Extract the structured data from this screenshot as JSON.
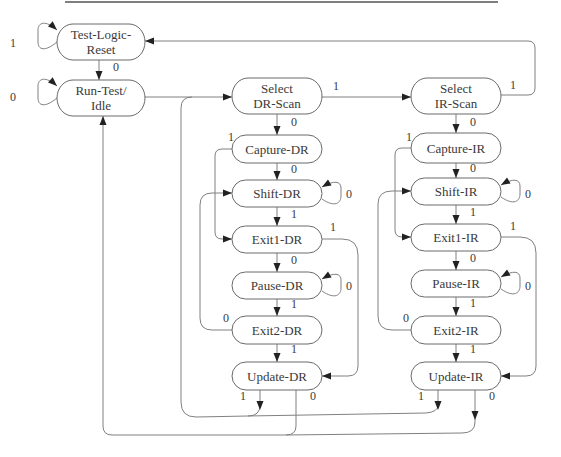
{
  "diagram": {
    "states": [
      {
        "id": "tlr",
        "lines": [
          "Test-Logic-",
          "Reset"
        ],
        "x": 57,
        "y": 24,
        "w": 88,
        "h": 36
      },
      {
        "id": "rti",
        "lines": [
          "Run-Test/",
          "Idle"
        ],
        "x": 57,
        "y": 80,
        "w": 88,
        "h": 36
      },
      {
        "id": "sdr",
        "lines": [
          "Select",
          "DR-Scan"
        ],
        "x": 232,
        "y": 78,
        "w": 90,
        "h": 36
      },
      {
        "id": "cdr",
        "lines": [
          "Capture-DR"
        ],
        "x": 232,
        "y": 135,
        "w": 90,
        "h": 28
      },
      {
        "id": "shdr",
        "lines": [
          "Shift-DR"
        ],
        "x": 232,
        "y": 180,
        "w": 90,
        "h": 27
      },
      {
        "id": "e1dr",
        "lines": [
          "Exit1-DR"
        ],
        "x": 232,
        "y": 226,
        "w": 90,
        "h": 27
      },
      {
        "id": "pdr",
        "lines": [
          "Pause-DR"
        ],
        "x": 232,
        "y": 272,
        "w": 90,
        "h": 27
      },
      {
        "id": "e2dr",
        "lines": [
          "Exit2-DR"
        ],
        "x": 232,
        "y": 316,
        "w": 90,
        "h": 28
      },
      {
        "id": "udr",
        "lines": [
          "Update-DR"
        ],
        "x": 232,
        "y": 362,
        "w": 90,
        "h": 28
      },
      {
        "id": "sir",
        "lines": [
          "Select",
          "IR-Scan"
        ],
        "x": 411,
        "y": 78,
        "w": 90,
        "h": 36
      },
      {
        "id": "cir",
        "lines": [
          "Capture-IR"
        ],
        "x": 411,
        "y": 133,
        "w": 90,
        "h": 30
      },
      {
        "id": "shir",
        "lines": [
          "Shift-IR"
        ],
        "x": 411,
        "y": 178,
        "w": 90,
        "h": 27
      },
      {
        "id": "e1ir",
        "lines": [
          "Exit1-IR"
        ],
        "x": 411,
        "y": 224,
        "w": 90,
        "h": 27
      },
      {
        "id": "pir",
        "lines": [
          "Pause-IR"
        ],
        "x": 411,
        "y": 270,
        "w": 90,
        "h": 27
      },
      {
        "id": "e2ir",
        "lines": [
          "Exit2-IR"
        ],
        "x": 411,
        "y": 316,
        "w": 90,
        "h": 28
      },
      {
        "id": "uir",
        "lines": [
          "Update-IR"
        ],
        "x": 411,
        "y": 362,
        "w": 90,
        "h": 28
      }
    ],
    "edges": [
      {
        "from": "tlr",
        "to": "tlr",
        "label": "1",
        "d": "M57,42 C45,52 38,50 38,42 L38,30 C38,22 46,20 57,30",
        "arrow": [
          57,
          30
        ],
        "lx": 10,
        "ly": 47
      },
      {
        "from": "tlr",
        "to": "rti",
        "label": "0",
        "d": "M99,60 L99,80",
        "arrow": [
          99,
          80
        ],
        "lx": 113,
        "ly": 71
      },
      {
        "from": "rti",
        "to": "rti",
        "label": "0",
        "d": "M57,98 C45,108 38,106 38,98 L38,86 C38,78 46,76 57,86",
        "arrow": [
          57,
          86
        ],
        "lx": 10,
        "ly": 101
      },
      {
        "from": "rti",
        "to": "sdr",
        "label": "",
        "d": "M145,97 L232,97",
        "arrow": [
          232,
          97
        ],
        "lx": 0,
        "ly": 0
      },
      {
        "from": "sdr",
        "to": "sir",
        "label": "1",
        "d": "M322,97 L411,97",
        "arrow": [
          411,
          97
        ],
        "lx": 333,
        "ly": 90
      },
      {
        "from": "sir",
        "to": "tlr",
        "label": "1",
        "d": "M501,95 L528,95 Q535,95 535,88 L535,48 Q535,41 528,41 L145,41",
        "arrow": [
          145,
          41
        ],
        "lx": 510,
        "ly": 89
      },
      {
        "from": "sdr",
        "to": "cdr",
        "label": "0",
        "d": "M277,114 L277,135",
        "arrow": [
          277,
          135
        ],
        "lx": 291,
        "ly": 126
      },
      {
        "from": "sir",
        "to": "cir",
        "label": "0",
        "d": "M456,114 L456,133",
        "arrow": [
          456,
          133
        ],
        "lx": 470,
        "ly": 126
      },
      {
        "from": "cdr",
        "to": "shdr",
        "label": "0",
        "d": "M277,163 L277,180",
        "arrow": [
          277,
          180
        ],
        "lx": 291,
        "ly": 173
      },
      {
        "from": "cdr",
        "to": "e1dr",
        "label": "1",
        "d": "M232,149 L222,149 Q215,149 215,156 L215,232 Q215,239 222,239 L232,239",
        "arrow": [
          232,
          239
        ],
        "lx": 228,
        "ly": 141
      },
      {
        "from": "shdr",
        "to": "shdr",
        "label": "0",
        "d": "M322,199 C335,208 341,203 341,196 L341,188 C341,181 334,180 322,187",
        "arrow": [
          322,
          187
        ],
        "lx": 346,
        "ly": 198
      },
      {
        "from": "shdr",
        "to": "e1dr",
        "label": "1",
        "d": "M277,207 L277,226",
        "arrow": [
          277,
          226
        ],
        "lx": 291,
        "ly": 218
      },
      {
        "from": "e1dr",
        "to": "pdr",
        "label": "0",
        "d": "M277,253 L277,272",
        "arrow": [
          277,
          272
        ],
        "lx": 291,
        "ly": 264
      },
      {
        "from": "e1dr",
        "to": "udr",
        "label": "1",
        "d": "M322,239 L342,239 Q358,239 358,255 L358,366 Q358,376 348,376 L322,376",
        "arrow": [
          322,
          376
        ],
        "lx": 330,
        "ly": 231
      },
      {
        "from": "pdr",
        "to": "pdr",
        "label": "0",
        "d": "M322,291 C335,300 341,295 341,288 L341,280 C341,273 334,272 322,279",
        "arrow": [
          322,
          279
        ],
        "lx": 346,
        "ly": 290
      },
      {
        "from": "pdr",
        "to": "e2dr",
        "label": "1",
        "d": "M277,299 L277,316",
        "arrow": [
          277,
          316
        ],
        "lx": 291,
        "ly": 308
      },
      {
        "from": "e2dr",
        "to": "shdr",
        "label": "0",
        "d": "M232,330 L212,330 Q200,330 200,318 L200,205 Q200,193 212,193 L232,193",
        "arrow": [
          232,
          193
        ],
        "lx": 223,
        "ly": 322
      },
      {
        "from": "e2dr",
        "to": "udr",
        "label": "1",
        "d": "M277,344 L277,362",
        "arrow": [
          277,
          362
        ],
        "lx": 291,
        "ly": 353
      },
      {
        "from": "cir",
        "to": "e1ir",
        "label": "1",
        "d": "M411,148 L402,148 Q395,148 395,155 L395,230 Q395,237 402,237 L411,237",
        "arrow": [
          411,
          237
        ],
        "lx": 406,
        "ly": 141
      },
      {
        "from": "cir",
        "to": "shir",
        "label": "0",
        "d": "M456,163 L456,178",
        "arrow": [
          456,
          178
        ],
        "lx": 470,
        "ly": 172
      },
      {
        "from": "shir",
        "to": "shir",
        "label": "0",
        "d": "M501,197 C514,206 520,201 520,194 L520,186 C520,179 513,178 501,185",
        "arrow": [
          501,
          185
        ],
        "lx": 525,
        "ly": 198
      },
      {
        "from": "shir",
        "to": "e1ir",
        "label": "1",
        "d": "M456,205 L456,224",
        "arrow": [
          456,
          224
        ],
        "lx": 470,
        "ly": 216
      },
      {
        "from": "e1ir",
        "to": "pir",
        "label": "0",
        "d": "M456,251 L456,270",
        "arrow": [
          456,
          270
        ],
        "lx": 470,
        "ly": 262
      },
      {
        "from": "e1ir",
        "to": "uir",
        "label": "1",
        "d": "M501,237 L520,237 Q536,237 536,253 L536,366 Q536,376 526,376 L501,376",
        "arrow": [
          501,
          376
        ],
        "lx": 510,
        "ly": 230
      },
      {
        "from": "pir",
        "to": "pir",
        "label": "0",
        "d": "M501,289 C514,298 520,293 520,286 L520,278 C520,271 513,270 501,277",
        "arrow": [
          501,
          277
        ],
        "lx": 525,
        "ly": 290
      },
      {
        "from": "pir",
        "to": "e2ir",
        "label": "1",
        "d": "M456,297 L456,316",
        "arrow": [
          456,
          316
        ],
        "lx": 470,
        "ly": 307
      },
      {
        "from": "e2ir",
        "to": "shir",
        "label": "0",
        "d": "M411,330 L392,330 Q378,330 378,316 L378,204 Q378,191 392,191 L411,191",
        "arrow": [
          411,
          191
        ],
        "lx": 403,
        "ly": 322
      },
      {
        "from": "e2ir",
        "to": "uir",
        "label": "1",
        "d": "M456,344 L456,362",
        "arrow": [
          456,
          362
        ],
        "lx": 470,
        "ly": 353
      },
      {
        "from": "udr",
        "to": "sdr",
        "label": "1",
        "d": "M260,390 L260,405 Q260,416 248,416 L196,417 Q181,417 181,402 L181,108 Q181,97 192,97",
        "arrow": [
          260,
          410
        ],
        "lx": 240,
        "ly": 400
      },
      {
        "from": "uir",
        "to": "sdr",
        "label": "1",
        "d": "M438,390 L438,405 Q438,412 426,413 L248,416",
        "arrow": [
          438,
          410
        ],
        "lx": 418,
        "ly": 400
      },
      {
        "from": "udr",
        "to": "rti",
        "label": "0",
        "d": "M296,390 L296,426 Q296,435 286,435 L112,435 Q103,435 103,426 L103,116",
        "arrow": [
          103,
          116
        ],
        "lx": 310,
        "ly": 400
      },
      {
        "from": "uir",
        "to": "rti",
        "label": "0",
        "d": "M475,390 L475,422 Q475,433 462,433 L286,435",
        "arrow": [
          475,
          420
        ],
        "lx": 489,
        "ly": 400
      }
    ]
  }
}
